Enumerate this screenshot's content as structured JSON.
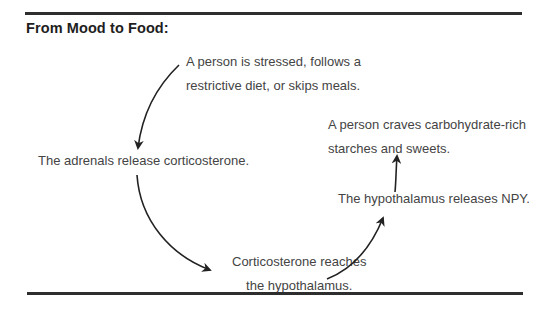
{
  "title": "From Mood to Food:",
  "nodes": {
    "stress": {
      "lines": [
        "A person is stressed, follows a",
        "restrictive diet, or skips meals."
      ]
    },
    "adrenals": {
      "lines": [
        "The adrenals release corticosterone."
      ]
    },
    "corticosterone": {
      "lines": [
        "Corticosterone reaches",
        "the hypothalamus."
      ]
    },
    "npy": {
      "lines": [
        "The hypothalamus releases NPY."
      ]
    },
    "craves": {
      "lines": [
        "A person craves carbohydrate-rich",
        "starches and sweets."
      ]
    }
  },
  "arrows": [
    {
      "from": "stress",
      "to": "adrenals"
    },
    {
      "from": "adrenals",
      "to": "corticosterone"
    },
    {
      "from": "corticosterone",
      "to": "npy"
    },
    {
      "from": "npy",
      "to": "craves"
    }
  ],
  "colors": {
    "rule": "#2e2e2e",
    "title": "#1e1e1e",
    "text": "#444444",
    "arrow": "#222222"
  }
}
